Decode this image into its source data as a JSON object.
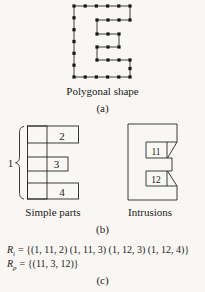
{
  "figure_a": {
    "caption": "Polygonal shape",
    "label": "(a)",
    "shape_name": "letter-E-polygon-with-vertex-dots",
    "polygon_points": [
      [
        74,
        6
      ],
      [
        130,
        6
      ],
      [
        130,
        20
      ],
      [
        97,
        20
      ],
      [
        97,
        34
      ],
      [
        119,
        34
      ],
      [
        119,
        47
      ],
      [
        97,
        47
      ],
      [
        97,
        60
      ],
      [
        130,
        60
      ],
      [
        130,
        77
      ],
      [
        74,
        77
      ]
    ]
  },
  "figure_b": {
    "label": "(b)",
    "simple_parts": {
      "caption": "Simple parts",
      "brace_label": "1",
      "part2_label": "2",
      "part3_label": "3",
      "part4_label": "4"
    },
    "intrusions": {
      "caption": "Intrusions",
      "intrusion1_label": "11",
      "intrusion2_label": "12"
    }
  },
  "figure_c": {
    "label": "(c)",
    "equations": [
      {
        "variable": "R",
        "subscript": "i",
        "body": "= {(1, 11, 2) (1, 11, 3) (1, 12, 3) (1, 12, 4)}"
      },
      {
        "variable": "R",
        "subscript": "p",
        "body": "= {(11, 3, 12)}"
      }
    ]
  }
}
